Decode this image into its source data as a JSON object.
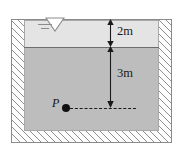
{
  "figure": {
    "type": "engineering-cross-section-diagram",
    "caption": ""
  },
  "symbols": {
    "water_level_icon": "inverted-triangle-water-surface-symbol"
  },
  "layers": [
    {
      "name": "upper-fluid-layer",
      "thickness_label": "2m",
      "fill_color": "#e4e4e4"
    },
    {
      "name": "lower-fluid-layer",
      "depth_label": "3m",
      "fill_color": "#bdbdbd"
    }
  ],
  "dimensions": [
    {
      "id": "upper-thickness",
      "label": "2m"
    },
    {
      "id": "lower-depth",
      "label": "3m"
    }
  ],
  "points": [
    {
      "id": "point-p",
      "label": "P"
    }
  ],
  "colors": {
    "hatch": "#8f8f8f",
    "outline": "#8a8a8a",
    "interface": "#6d6d6d",
    "upper_layer": "#e4e4e4",
    "lower_layer": "#bdbdbd",
    "point": "#111111"
  }
}
